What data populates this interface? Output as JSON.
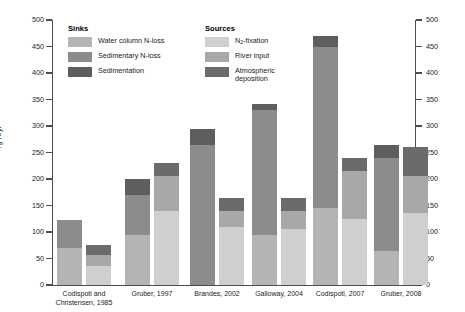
{
  "chart_data": {
    "type": "bar",
    "title": "",
    "subtitle": "",
    "xlabel": "",
    "ylabel": "Tg N/yr",
    "ylim": [
      0,
      500
    ],
    "yticks": [
      0,
      50,
      100,
      150,
      200,
      250,
      300,
      350,
      400,
      450,
      500
    ],
    "ytick_labels": [
      "0",
      "50",
      "100",
      "150",
      "200",
      "250",
      "300",
      "350",
      "400",
      "450",
      "500"
    ],
    "right_axis": {
      "ylim": [
        0,
        500
      ],
      "yticks": [
        0,
        50,
        100,
        150,
        200,
        250,
        300,
        350,
        400,
        450,
        500
      ],
      "ytick_labels": [
        "0",
        "50",
        "100",
        "150",
        "200",
        "250",
        "300",
        "350",
        "400",
        "450",
        "500"
      ]
    },
    "grid": false,
    "stacked": true,
    "legend_position": "top-inside",
    "categories": [
      "Codispoti and\nChristensen, 1985",
      "Gruber, 1997",
      "Brandes, 2002",
      "Galloway, 2004",
      "Codispoti, 2007",
      "Gruber, 2008"
    ],
    "bar_pairs": [
      "Sinks",
      "Sources"
    ],
    "series": [
      {
        "name": "Water column N-loss",
        "group": "Sinks",
        "color": "#b4b4b4",
        "values": [
          70,
          95,
          0,
          95,
          145,
          65
        ]
      },
      {
        "name": "Sedimentary N-loss",
        "group": "Sinks",
        "color": "#8c8c8c",
        "values": [
          52,
          75,
          265,
          235,
          305,
          175
        ]
      },
      {
        "name": "Sedimentation",
        "group": "Sinks",
        "color": "#5e5e5e",
        "values": [
          0,
          30,
          30,
          12,
          20,
          25
        ]
      },
      {
        "name": "N2-fixation",
        "group": "Sources",
        "color": "#cfcfcf",
        "values": [
          35,
          140,
          110,
          105,
          125,
          135
        ]
      },
      {
        "name": "River input",
        "group": "Sources",
        "color": "#a8a8a8",
        "values": [
          22,
          65,
          30,
          35,
          90,
          70
        ]
      },
      {
        "name": "Atmospheric deposition",
        "group": "Sources",
        "color": "#6b6b6b",
        "values": [
          18,
          25,
          25,
          25,
          25,
          55
        ]
      }
    ],
    "totals": {
      "Sinks": [
        122,
        200,
        295,
        342,
        470,
        265
      ],
      "Sources": [
        75,
        230,
        165,
        165,
        240,
        260
      ]
    }
  },
  "legend": {
    "sinks": {
      "title": "Sinks",
      "items": [
        {
          "label": "Water column N-loss",
          "color": "#b4b4b4"
        },
        {
          "label": "Sedimentary N-loss",
          "color": "#8c8c8c"
        },
        {
          "label": "Sedimentation",
          "color": "#5e5e5e"
        }
      ]
    },
    "sources": {
      "title": "Sources",
      "items": [
        {
          "label": "N2-fixation",
          "label_base": "N",
          "label_sub": "2",
          "label_rest": "-fixation",
          "color": "#cfcfcf"
        },
        {
          "label": "River input",
          "color": "#a8a8a8"
        },
        {
          "label": "Atmospheric\ndeposition",
          "color": "#6b6b6b"
        }
      ]
    }
  },
  "axes": {
    "ylabel": "Tg N/yr"
  },
  "colors": {
    "axis": "#4d4d4d",
    "text": "#1a1a1a",
    "background": "#ffffff"
  }
}
